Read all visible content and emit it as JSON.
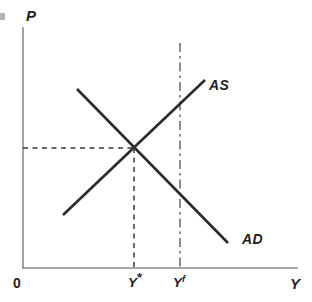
{
  "figure": {
    "kind": "macroeconomics-ad-as-diagram",
    "background_color": "#ffffff",
    "axis_color": "#8a8a8a",
    "curve_color": "#2b2b2b",
    "guide_color": "#3a3a3a"
  },
  "axes": {
    "y_axis_label": "P",
    "x_axis_label": "Y",
    "origin_label": "0"
  },
  "curves": [
    {
      "id": "as",
      "label": "AS",
      "description": "Aggregate Supply, upward sloping",
      "x1": 63,
      "y1": 215,
      "x2": 205,
      "y2": 80,
      "label_x": 209,
      "label_y": 77
    },
    {
      "id": "ad",
      "label": "AD",
      "description": "Aggregate Demand, downward sloping",
      "x1": 77,
      "y1": 89,
      "x2": 228,
      "y2": 243,
      "label_x": 242,
      "label_y": 231
    }
  ],
  "guides": {
    "equilibrium_point": {
      "x": 134,
      "y": 148
    },
    "price_dashed_line": {
      "x1": 23,
      "y1": 148,
      "x2": 134,
      "y2": 148
    },
    "output_dashed_line": {
      "x1": 134,
      "y1": 148,
      "x2": 134,
      "y2": 268
    },
    "full_employment_line": {
      "x1": 180,
      "y1": 43,
      "x2": 180,
      "y2": 268
    }
  },
  "x_tick_labels": [
    {
      "id": "y-star",
      "base": "Y",
      "superscript": "*",
      "x": 128,
      "y": 276
    },
    {
      "id": "y-full",
      "base": "Y",
      "superscript": "f",
      "x": 173,
      "y": 276
    }
  ],
  "chart_data": {
    "type": "line",
    "title": "",
    "xlabel": "Y",
    "ylabel": "P",
    "grid": false,
    "legend": "inline-curve-labels",
    "xlim": [
      0,
      100
    ],
    "ylim": [
      0,
      100
    ],
    "annotations": [
      "0",
      "Y*",
      "Yf",
      "AS",
      "AD",
      "P",
      "Y"
    ],
    "series": [
      {
        "name": "AS",
        "kind": "upward-sloping-supply",
        "points": [
          [
            14.6,
            22.1
          ],
          [
            51.8,
            78.3
          ]
        ]
      },
      {
        "name": "AD",
        "kind": "downward-sloping-demand",
        "points": [
          [
            19.7,
            74.6
          ],
          [
            74.8,
            10.4
          ]
        ]
      },
      {
        "name": "Equilibrium",
        "kind": "intersection-point",
        "points": [
          [
            40.5,
            50.0
          ]
        ]
      },
      {
        "name": "Yf",
        "kind": "full-employment-vertical",
        "points": [
          [
            57.3,
            0
          ],
          [
            57.3,
            93.8
          ]
        ]
      }
    ]
  }
}
